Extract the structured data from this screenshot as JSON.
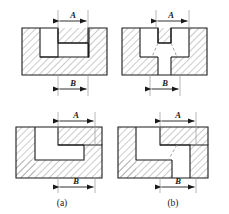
{
  "figure": {
    "type": "engineering-cross-section-comparison",
    "background_color": "#ffffff",
    "outline_color": "#1a1a1a",
    "hatch_color": "#8c8c8c",
    "dimension_color": "#1a1a1a",
    "dashed_color": "#9a9a9a",
    "captions": [
      {
        "id": "a",
        "text": "(a)"
      },
      {
        "id": "b",
        "text": "(b)"
      }
    ],
    "panels": [
      {
        "id": "top-left",
        "column": "a",
        "row": "top",
        "shape": "t-slot-section",
        "description": "T-shaped slot, wide at top, narrow neck below",
        "has_dashed_transition": false,
        "dimensions": [
          {
            "name": "A",
            "label": "A",
            "position": "top",
            "measures": "upper slot width"
          },
          {
            "name": "B",
            "label": "B",
            "position": "bottom",
            "measures": "lower neck width"
          }
        ]
      },
      {
        "id": "top-right",
        "column": "b",
        "row": "top",
        "shape": "t-slot-section",
        "description": "Narrow top slot widening into broader lower cavity with dashed transition lines",
        "has_dashed_transition": true,
        "dimensions": [
          {
            "name": "A",
            "label": "A",
            "position": "top",
            "measures": "upper slot width"
          },
          {
            "name": "B",
            "label": "B",
            "position": "bottom",
            "measures": "lower cavity width"
          }
        ]
      },
      {
        "id": "bottom-left",
        "column": "a",
        "row": "bottom",
        "shape": "stepped-z-section",
        "description": "Z-shaped stepped cavity with square corner",
        "has_dashed_transition": false,
        "dimensions": [
          {
            "name": "A",
            "label": "A",
            "position": "top",
            "measures": "upper step width"
          },
          {
            "name": "B",
            "label": "B",
            "position": "bottom",
            "measures": "lower step width"
          }
        ]
      },
      {
        "id": "bottom-right",
        "column": "b",
        "row": "bottom",
        "shape": "stepped-z-section",
        "description": "Z-shaped stepped cavity with diagonal dashed transition at inner corner",
        "has_dashed_transition": true,
        "dimensions": [
          {
            "name": "A",
            "label": "A",
            "position": "top",
            "measures": "upper step width"
          },
          {
            "name": "B",
            "label": "B",
            "position": "bottom",
            "measures": "lower step width"
          }
        ]
      }
    ]
  }
}
